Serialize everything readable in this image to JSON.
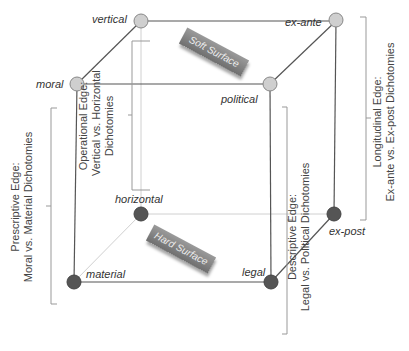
{
  "nodes": {
    "vertical": {
      "label": "vertical",
      "color": "#cccccc"
    },
    "ex_ante": {
      "label": "ex-ante",
      "color": "#cccccc"
    },
    "moral": {
      "label": "moral",
      "color": "#cccccc"
    },
    "political": {
      "label": "political",
      "color": "#cccccc"
    },
    "horizontal": {
      "label": "horizontal",
      "color": "#555555"
    },
    "ex_post": {
      "label": "ex-post",
      "color": "#555555"
    },
    "material": {
      "label": "material",
      "color": "#555555"
    },
    "legal": {
      "label": "legal",
      "color": "#555555"
    }
  },
  "surfaces": {
    "soft": "Soft Surface",
    "hard": "Hard Surface"
  },
  "edges": {
    "operational": {
      "line1": "Operational Edge:",
      "line2": "Vertical vs. Horizontal",
      "line3": "Dichotomies"
    },
    "prescriptive": {
      "line1": "Prescriptive Edge:",
      "line2": "Moral vs. Material Dichotomies"
    },
    "descriptive": {
      "line1": "Descriptive Edge:",
      "line2": "Legal vs. Political Dichotomies"
    },
    "longitudinal": {
      "line1": "Longitudinal Edge:",
      "line2": "Ex-ante vs. Ex-post Dichotomies"
    }
  }
}
